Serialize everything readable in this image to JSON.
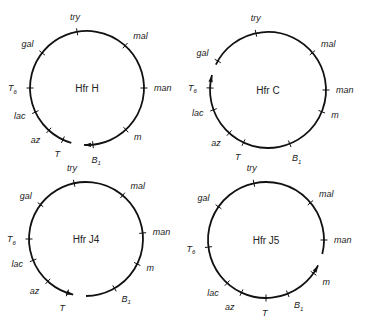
{
  "figure": {
    "diagrams": [
      {
        "id": "hfr-h",
        "title": "Hfr H",
        "direction": "clockwise",
        "origin_between": [
          "T",
          "B1"
        ],
        "genes": [
          {
            "name": "try",
            "sub": ""
          },
          {
            "name": "mal",
            "sub": ""
          },
          {
            "name": "man",
            "sub": ""
          },
          {
            "name": "m",
            "sub": ""
          },
          {
            "name": "B",
            "sub": "1"
          },
          {
            "name": "T",
            "sub": ""
          },
          {
            "name": "az",
            "sub": ""
          },
          {
            "name": "lac",
            "sub": ""
          },
          {
            "name": "T",
            "sub": "6"
          },
          {
            "name": "gal",
            "sub": ""
          }
        ]
      },
      {
        "id": "hfr-c",
        "title": "Hfr C",
        "direction": "clockwise",
        "origin_between": [
          "T6",
          "gal"
        ],
        "genes": [
          {
            "name": "try",
            "sub": ""
          },
          {
            "name": "mal",
            "sub": ""
          },
          {
            "name": "man",
            "sub": ""
          },
          {
            "name": "m",
            "sub": ""
          },
          {
            "name": "B",
            "sub": "1"
          },
          {
            "name": "T",
            "sub": ""
          },
          {
            "name": "az",
            "sub": ""
          },
          {
            "name": "lac",
            "sub": ""
          },
          {
            "name": "T",
            "sub": "6"
          },
          {
            "name": "gal",
            "sub": ""
          }
        ]
      },
      {
        "id": "hfr-j4",
        "title": "Hfr J4",
        "direction": "counterclockwise",
        "origin_between": [
          "T",
          "B1"
        ],
        "genes": [
          {
            "name": "try",
            "sub": ""
          },
          {
            "name": "mal",
            "sub": ""
          },
          {
            "name": "man",
            "sub": ""
          },
          {
            "name": "m",
            "sub": ""
          },
          {
            "name": "B",
            "sub": "1"
          },
          {
            "name": "T",
            "sub": ""
          },
          {
            "name": "az",
            "sub": ""
          },
          {
            "name": "lac",
            "sub": ""
          },
          {
            "name": "T",
            "sub": "6"
          },
          {
            "name": "gal",
            "sub": ""
          }
        ]
      },
      {
        "id": "hfr-j5",
        "title": "Hfr J5",
        "direction": "counterclockwise",
        "origin_between": [
          "man",
          "m"
        ],
        "genes": [
          {
            "name": "try",
            "sub": ""
          },
          {
            "name": "mal",
            "sub": ""
          },
          {
            "name": "man",
            "sub": ""
          },
          {
            "name": "m",
            "sub": ""
          },
          {
            "name": "B",
            "sub": "1"
          },
          {
            "name": "T",
            "sub": ""
          },
          {
            "name": "az",
            "sub": ""
          },
          {
            "name": "lac",
            "sub": ""
          },
          {
            "name": "T",
            "sub": "6"
          },
          {
            "name": "gal",
            "sub": ""
          }
        ]
      }
    ]
  }
}
